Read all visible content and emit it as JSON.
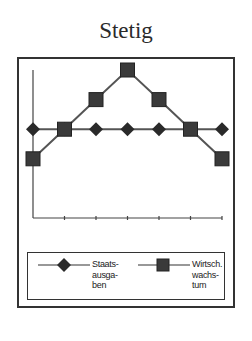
{
  "title": "Stetig",
  "chart_data": {
    "type": "line",
    "title": "Stetig",
    "xlabel": "",
    "ylabel": "",
    "x": [
      1,
      2,
      3,
      4,
      5,
      6,
      7
    ],
    "ylim": [
      0,
      6
    ],
    "grid": false,
    "tick_labels_shown": false,
    "legend_position": "bottom",
    "series": [
      {
        "name": "Staatsausgaben",
        "label_display": "Staats-\nausga-\nben",
        "marker": "diamond",
        "values": [
          3,
          3,
          3,
          3,
          3,
          3,
          3
        ]
      },
      {
        "name": "Wirtschaftswachstum",
        "label_display": "Wirtsch.\nwachs-\ntum",
        "marker": "square",
        "values": [
          2,
          3,
          4,
          5,
          4,
          3,
          2
        ]
      }
    ]
  },
  "legend": {
    "item1": "Staats-\nausga-\nben",
    "item2": "Wirtsch.\nwachs-\ntum"
  },
  "colors": {
    "line": "#555555",
    "marker": "#333333",
    "frame": "#333333"
  }
}
